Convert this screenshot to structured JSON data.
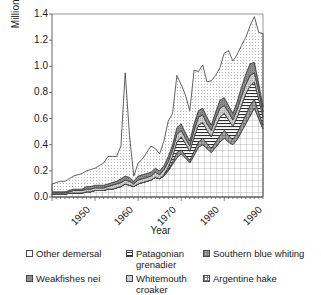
{
  "chart_data": {
    "type": "area",
    "stacked": true,
    "title": "",
    "xlabel": "Year",
    "ylabel": "Million tonnes",
    "ylim": [
      0.0,
      1.4
    ],
    "xlim": [
      1950,
      1999
    ],
    "yticks": [
      "0.0",
      "0.2",
      "0.4",
      "0.6",
      "0.8",
      "1.0",
      "1.2",
      "1.4"
    ],
    "ytick_values": [
      0.0,
      0.2,
      0.4,
      0.6,
      0.8,
      1.0,
      1.2,
      1.4
    ],
    "xticks": [
      "1950",
      "1960",
      "1970",
      "1980",
      "1990"
    ],
    "xtick_values": [
      1950,
      1960,
      1970,
      1980,
      1990
    ],
    "xtick_rotation": -45,
    "grid": false,
    "legend_position": "bottom",
    "x": [
      1950,
      1951,
      1952,
      1953,
      1954,
      1955,
      1956,
      1957,
      1958,
      1959,
      1960,
      1961,
      1962,
      1963,
      1964,
      1965,
      1966,
      1967,
      1968,
      1969,
      1970,
      1971,
      1972,
      1973,
      1974,
      1975,
      1976,
      1977,
      1978,
      1979,
      1980,
      1981,
      1982,
      1983,
      1984,
      1985,
      1986,
      1987,
      1988,
      1989,
      1990,
      1991,
      1992,
      1993,
      1994,
      1995,
      1996,
      1997,
      1998,
      1999
    ],
    "series": [
      {
        "name": "Argentine hake",
        "fill": "grid",
        "values": [
          0.02,
          0.02,
          0.02,
          0.02,
          0.03,
          0.03,
          0.03,
          0.03,
          0.04,
          0.04,
          0.05,
          0.05,
          0.05,
          0.06,
          0.06,
          0.07,
          0.08,
          0.1,
          0.09,
          0.08,
          0.1,
          0.11,
          0.12,
          0.13,
          0.15,
          0.14,
          0.16,
          0.2,
          0.25,
          0.3,
          0.33,
          0.3,
          0.26,
          0.32,
          0.38,
          0.4,
          0.37,
          0.34,
          0.38,
          0.42,
          0.45,
          0.42,
          0.4,
          0.44,
          0.5,
          0.56,
          0.62,
          0.68,
          0.6,
          0.52
        ]
      },
      {
        "name": "Southern blue whiting",
        "fill": "dark-grid",
        "values": [
          0.0,
          0.0,
          0.0,
          0.0,
          0.0,
          0.0,
          0.0,
          0.0,
          0.0,
          0.0,
          0.0,
          0.0,
          0.0,
          0.0,
          0.0,
          0.0,
          0.0,
          0.0,
          0.0,
          0.0,
          0.0,
          0.0,
          0.0,
          0.0,
          0.0,
          0.0,
          0.0,
          0.01,
          0.02,
          0.04,
          0.03,
          0.02,
          0.02,
          0.03,
          0.04,
          0.05,
          0.04,
          0.03,
          0.04,
          0.05,
          0.06,
          0.05,
          0.04,
          0.05,
          0.06,
          0.07,
          0.08,
          0.07,
          0.05,
          0.03
        ]
      },
      {
        "name": "Patagonian grenadier",
        "fill": "hlines",
        "values": [
          0.0,
          0.0,
          0.0,
          0.0,
          0.0,
          0.0,
          0.0,
          0.0,
          0.0,
          0.0,
          0.0,
          0.0,
          0.0,
          0.0,
          0.0,
          0.0,
          0.0,
          0.0,
          0.0,
          0.0,
          0.0,
          0.0,
          0.0,
          0.0,
          0.0,
          0.0,
          0.01,
          0.02,
          0.04,
          0.08,
          0.1,
          0.09,
          0.07,
          0.11,
          0.13,
          0.12,
          0.1,
          0.09,
          0.12,
          0.14,
          0.13,
          0.12,
          0.1,
          0.12,
          0.14,
          0.16,
          0.15,
          0.13,
          0.1,
          0.06
        ]
      },
      {
        "name": "Whitemouth croaker",
        "fill": "light-grey",
        "values": [
          0.01,
          0.01,
          0.01,
          0.01,
          0.01,
          0.02,
          0.02,
          0.02,
          0.02,
          0.02,
          0.02,
          0.02,
          0.02,
          0.02,
          0.03,
          0.03,
          0.03,
          0.03,
          0.03,
          0.02,
          0.03,
          0.03,
          0.03,
          0.03,
          0.04,
          0.03,
          0.04,
          0.04,
          0.05,
          0.06,
          0.05,
          0.04,
          0.04,
          0.05,
          0.06,
          0.06,
          0.05,
          0.05,
          0.06,
          0.07,
          0.06,
          0.06,
          0.05,
          0.06,
          0.07,
          0.07,
          0.08,
          0.07,
          0.06,
          0.04
        ]
      },
      {
        "name": "Weakfishes nei",
        "fill": "mid-grey",
        "values": [
          0.01,
          0.01,
          0.01,
          0.01,
          0.01,
          0.01,
          0.01,
          0.01,
          0.02,
          0.02,
          0.02,
          0.02,
          0.02,
          0.02,
          0.02,
          0.02,
          0.03,
          0.03,
          0.03,
          0.02,
          0.03,
          0.03,
          0.03,
          0.03,
          0.03,
          0.03,
          0.03,
          0.04,
          0.04,
          0.05,
          0.05,
          0.04,
          0.04,
          0.05,
          0.05,
          0.05,
          0.05,
          0.04,
          0.05,
          0.06,
          0.06,
          0.05,
          0.05,
          0.06,
          0.07,
          0.08,
          0.09,
          0.08,
          0.06,
          0.04
        ]
      },
      {
        "name": "Other demersal",
        "fill": "dots",
        "values": [
          0.06,
          0.07,
          0.08,
          0.08,
          0.09,
          0.1,
          0.11,
          0.12,
          0.12,
          0.13,
          0.13,
          0.15,
          0.17,
          0.21,
          0.2,
          0.19,
          0.25,
          0.79,
          0.32,
          0.04,
          0.1,
          0.12,
          0.16,
          0.2,
          0.15,
          0.13,
          0.19,
          0.27,
          0.24,
          0.4,
          0.3,
          0.29,
          0.23,
          0.41,
          0.3,
          0.33,
          0.27,
          0.34,
          0.28,
          0.25,
          0.34,
          0.42,
          0.4,
          0.36,
          0.32,
          0.28,
          0.29,
          0.35,
          0.39,
          0.56
        ]
      }
    ],
    "totals": [
      0.1,
      0.11,
      0.12,
      0.12,
      0.14,
      0.16,
      0.17,
      0.18,
      0.2,
      0.21,
      0.22,
      0.24,
      0.26,
      0.31,
      0.31,
      0.31,
      0.39,
      0.95,
      0.47,
      0.16,
      0.26,
      0.29,
      0.34,
      0.39,
      0.37,
      0.33,
      0.43,
      0.58,
      0.64,
      0.93,
      0.86,
      0.78,
      0.66,
      0.97,
      0.96,
      1.01,
      0.88,
      0.89,
      0.93,
      0.99,
      1.1,
      1.12,
      1.04,
      1.09,
      1.16,
      1.22,
      1.31,
      1.38,
      1.26,
      1.25
    ],
    "legend": [
      {
        "label": "Other demersal",
        "swatch": "dots"
      },
      {
        "label": "Weakfishes nei",
        "swatch": "mid-grey"
      },
      {
        "label": "Patagonian grenadier",
        "swatch": "hlines"
      },
      {
        "label": "Whitemouth croaker",
        "swatch": "light-grey"
      },
      {
        "label": "Southern blue whiting",
        "swatch": "dark-grid"
      },
      {
        "label": "Argentine hake",
        "swatch": "grid"
      }
    ],
    "colors": {
      "axis": "#555555",
      "outline": "#3a3a3a",
      "dots": "#f2f2f2",
      "mid_grey": "#8c8c8c",
      "light_grey": "#c9c9c9",
      "dark_grid": "#9a9a9a",
      "grid": "#ffffff",
      "hlines": "#ffffff"
    }
  }
}
